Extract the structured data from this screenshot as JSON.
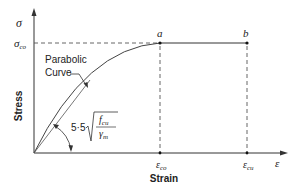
{
  "diagram": {
    "y_axis": {
      "symbol": "σ",
      "label": "Stress",
      "tick_label": "σ",
      "tick_sub": "co"
    },
    "x_axis": {
      "symbol": "ε",
      "label": "Strain",
      "ticks": [
        {
          "main": "ε",
          "sub": "co"
        },
        {
          "main": "ε",
          "sub": "cu"
        }
      ]
    },
    "points": [
      {
        "label": "a"
      },
      {
        "label": "b"
      }
    ],
    "curve_label_line1": "Parabolic",
    "curve_label_line2": "Curve",
    "slope_formula": {
      "coef": "5·5",
      "numerator": "f",
      "numerator_sub": "cu",
      "denominator": "γ",
      "denominator_sub": "m"
    }
  },
  "colors": {
    "line": "#333333",
    "dash": "#555555",
    "text": "#222222"
  }
}
